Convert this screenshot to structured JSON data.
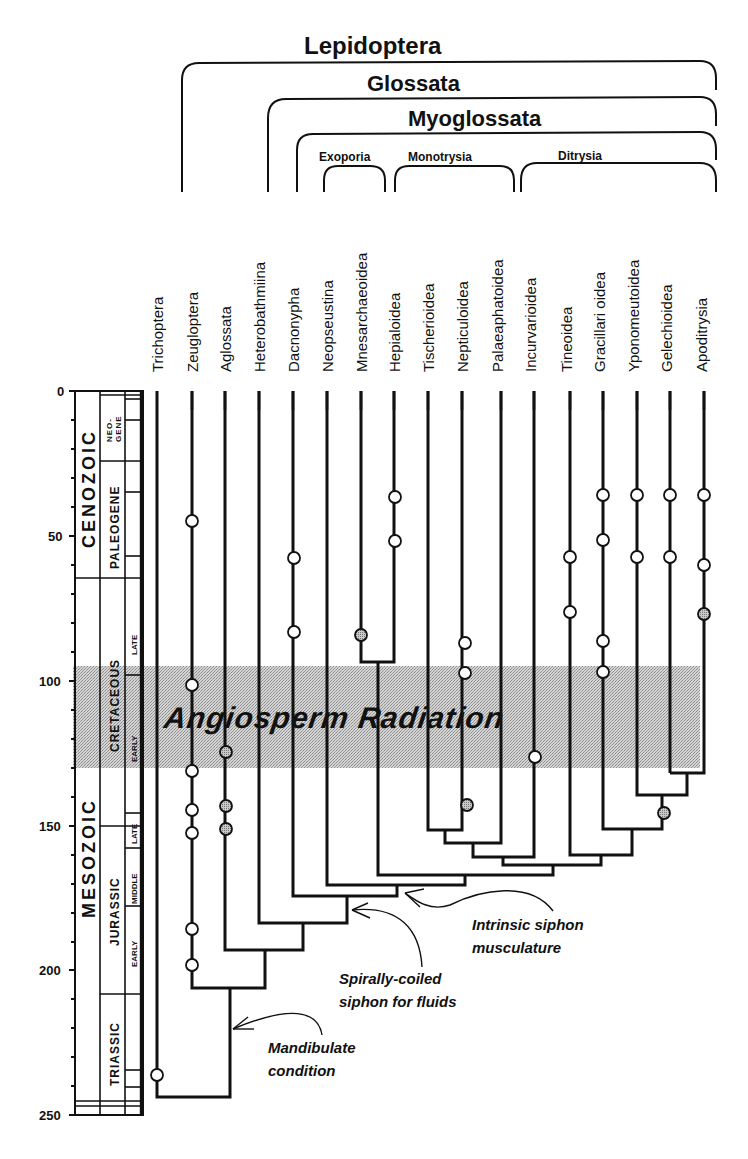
{
  "figure": {
    "type": "phylogeny-with-geologic-timescale",
    "clades": {
      "lepidoptera": "Lepidoptera",
      "glossata": "Glossata",
      "myoglossata": "Myoglossata",
      "exoporia": "Exoporia",
      "monotrysia": "Monotrysia",
      "ditrysia": "Ditrysia"
    },
    "taxa": [
      "Trichoptera",
      "Zeugloptera",
      "Aglossata",
      "Heterobathmiina",
      "Dacnonypha",
      "Neopseustina",
      "Mnesarchaeoidea",
      "Hepialoidea",
      "Tischerioidea",
      "Nepticuloidea",
      "Palaeaphatoidea",
      "Incurvarioidea",
      "Tineoidea",
      "Gracillari oidea",
      "Yponomeutoidea",
      "Gelechioidea",
      "Apoditrysia"
    ],
    "axis": {
      "unit": "Ma",
      "ticks": [
        "0",
        "50",
        "100",
        "150",
        "200",
        "250"
      ]
    },
    "timescale": {
      "eras": [
        "CENOZOIC",
        "MESOZOIC"
      ],
      "periods": [
        "NEO-GENE",
        "PALEOGENE",
        "CRETACEOUS",
        "JURASSIC",
        "TRIASSIC"
      ],
      "neogene_top": "NEO-",
      "neogene_bottom": "GENE",
      "epochs": {
        "cretaceous_late": "LATE",
        "cretaceous_early": "EARLY",
        "jurassic_late": "LATE",
        "jurassic_middle": "MIDDLE",
        "jurassic_early": "EARLY"
      }
    },
    "highlight_band": {
      "label": "Angiosperm Radiation",
      "from_ma": 95,
      "to_ma": 130
    },
    "annotations": {
      "intrinsic_line1": "Intrinsic siphon",
      "intrinsic_line2": "musculature",
      "spiral_line1": "Spirally-coiled",
      "spiral_line2": "siphon for fluids",
      "mandibulate_line1": "Mandibulate",
      "mandibulate_line2": "condition"
    },
    "colors": {
      "ink": "#111111",
      "band": "#c8c8c8",
      "open_marker": "#ffffff",
      "shaded_marker": "#9a9a9a"
    }
  }
}
